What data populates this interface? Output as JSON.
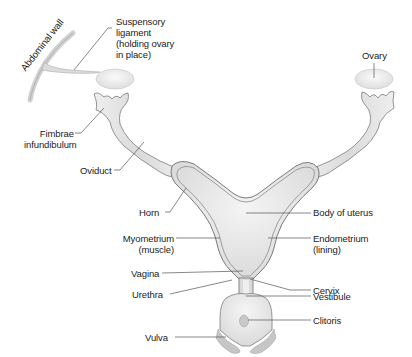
{
  "diagram": {
    "colors": {
      "outline": "#7a7a7a",
      "fill_light": "#f2f2f2",
      "fill_mid": "#dcdcdc",
      "leader_line": "#555555",
      "text": "#222222"
    },
    "labels": {
      "abdominal_wall": "Abdominal wall",
      "suspensory_ligament": "Suspensory\nligament\n(holding ovary\nin place)",
      "ovary": "Ovary",
      "fimbrae": "Fimbrae\ninfundibulum",
      "oviduct": "Oviduct",
      "horn": "Horn",
      "body_of_uterus": "Body of uterus",
      "myometrium": "Myometrium\n(muscle)",
      "endometrium": "Endometrium\n(lining)",
      "vagina": "Vagina",
      "cervix": "Cervix",
      "urethra": "Urethra",
      "vestibule": "Vestibule",
      "clitoris": "Clitoris",
      "vulva": "Vulva"
    }
  }
}
